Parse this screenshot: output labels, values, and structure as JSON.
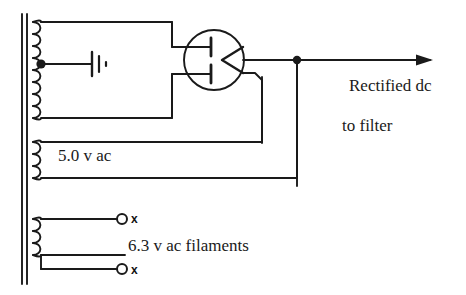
{
  "diagram": {
    "stroke_color": "#1a1a1a",
    "background_color": "#ffffff"
  },
  "labels": {
    "rectified_line1": "Rectified dc",
    "rectified_line2": "to filter",
    "high_voltage_winding": "",
    "filament_rectifier": "5.0 v ac",
    "filament_tubes": "6.3 v ac filaments",
    "terminal_mark_top": "x",
    "terminal_mark_bottom": "x"
  },
  "components": {
    "transformer": {
      "core_label": "laminated-core",
      "windings": [
        {
          "name": "secondary-high-voltage",
          "turns": 8,
          "center_tapped": true,
          "ground": true
        },
        {
          "name": "secondary-rectifier-filament",
          "turns": 3,
          "voltage": "5.0 v ac"
        },
        {
          "name": "secondary-tube-filaments",
          "turns": 3,
          "voltage": "6.3 v ac"
        }
      ]
    },
    "tube": {
      "name": "full-wave-rectifier-tube",
      "elements": [
        "filament-upper",
        "filament-lower",
        "plate-cathode-v"
      ]
    },
    "junction": {
      "name": "output-junction-dot"
    },
    "output_arrow": {
      "name": "dc-output-arrow",
      "direction": "right"
    },
    "terminals": [
      {
        "name": "filament-terminal-top",
        "mark": "x"
      },
      {
        "name": "filament-terminal-bottom",
        "mark": "x"
      }
    ]
  }
}
